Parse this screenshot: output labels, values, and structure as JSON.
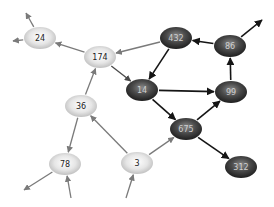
{
  "diagram": {
    "type": "directed-graph",
    "colors": {
      "light_node": "#d9d9d9",
      "dark_node": "#3a3a3a",
      "light_edge": "#808080",
      "dark_edge": "#1a1a1a",
      "light_text": "#222222",
      "dark_text": "#d0d0d0"
    },
    "nodes": [
      {
        "id": "24",
        "label": "24",
        "x": 40,
        "y": 38,
        "style": "light"
      },
      {
        "id": "174",
        "label": "174",
        "x": 100,
        "y": 57,
        "style": "light"
      },
      {
        "id": "432",
        "label": "432",
        "x": 176,
        "y": 38,
        "style": "dark"
      },
      {
        "id": "86",
        "label": "86",
        "x": 230,
        "y": 46,
        "style": "dark"
      },
      {
        "id": "14",
        "label": "14",
        "x": 142,
        "y": 90,
        "style": "dark"
      },
      {
        "id": "99",
        "label": "99",
        "x": 231,
        "y": 92,
        "style": "dark"
      },
      {
        "id": "36",
        "label": "36",
        "x": 81,
        "y": 106,
        "style": "light"
      },
      {
        "id": "675",
        "label": "675",
        "x": 186,
        "y": 129,
        "style": "dark"
      },
      {
        "id": "78",
        "label": "78",
        "x": 65,
        "y": 164,
        "style": "light"
      },
      {
        "id": "3",
        "label": "3",
        "x": 137,
        "y": 163,
        "style": "light"
      },
      {
        "id": "312",
        "label": "312",
        "x": 241,
        "y": 167,
        "style": "dark"
      }
    ],
    "edges": [
      {
        "from": "174",
        "to": "24",
        "style": "light"
      },
      {
        "from": "24",
        "to_point": [
          26,
          13
        ],
        "style": "light"
      },
      {
        "from": "24",
        "to_point": [
          13,
          41
        ],
        "style": "light"
      },
      {
        "from": "432",
        "to": "174",
        "style": "light"
      },
      {
        "from": "174",
        "to": "14",
        "style": "mid"
      },
      {
        "from": "36",
        "to": "174",
        "style": "light"
      },
      {
        "from": "432",
        "to": "14",
        "style": "dark"
      },
      {
        "from": "86",
        "to": "432",
        "style": "dark"
      },
      {
        "from": "86",
        "to_point": [
          262,
          20
        ],
        "style": "dark"
      },
      {
        "from": "14",
        "to": "99",
        "style": "dark"
      },
      {
        "from": "14",
        "to": "675",
        "style": "dark"
      },
      {
        "from": "99",
        "to": "86",
        "style": "dark"
      },
      {
        "from": "675",
        "to": "99",
        "style": "dark"
      },
      {
        "from": "675",
        "to": "312",
        "style": "dark"
      },
      {
        "from": "36",
        "to": "78",
        "style": "light"
      },
      {
        "from": "3",
        "to": "36",
        "style": "light"
      },
      {
        "from": "3",
        "to": "675",
        "style": "light"
      },
      {
        "from_point": [
          71,
          198
        ],
        "to": "78",
        "style": "light"
      },
      {
        "from_point": [
          126,
          198
        ],
        "to": "3",
        "style": "light"
      },
      {
        "from": "78",
        "to_point": [
          24,
          190
        ],
        "style": "light"
      }
    ]
  }
}
